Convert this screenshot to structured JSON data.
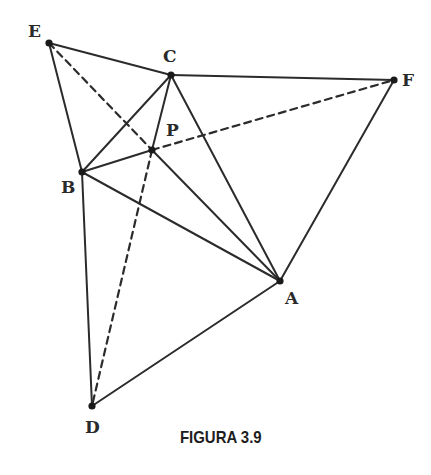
{
  "figure": {
    "caption": "FIGURA 3.9",
    "points": {
      "E": {
        "label": "E",
        "x": 49,
        "y": 43,
        "lx": 28,
        "ly": 37
      },
      "C": {
        "label": "C",
        "x": 171,
        "y": 75,
        "lx": 163,
        "ly": 62
      },
      "F": {
        "label": "F",
        "x": 394,
        "y": 80,
        "lx": 402,
        "ly": 86
      },
      "P": {
        "label": "P",
        "x": 152,
        "y": 150,
        "lx": 166,
        "ly": 136
      },
      "B": {
        "label": "B",
        "x": 82,
        "y": 172,
        "lx": 61,
        "ly": 193
      },
      "A": {
        "label": "A",
        "x": 280,
        "y": 281,
        "lx": 285,
        "ly": 304
      },
      "D": {
        "label": "D",
        "x": 92,
        "y": 406,
        "lx": 85,
        "ly": 433
      }
    },
    "solid_segments": [
      [
        "E",
        "C"
      ],
      [
        "C",
        "F"
      ],
      [
        "F",
        "A"
      ],
      [
        "E",
        "B"
      ],
      [
        "B",
        "D"
      ],
      [
        "D",
        "A"
      ],
      [
        "B",
        "C"
      ],
      [
        "C",
        "A"
      ],
      [
        "B",
        "A"
      ],
      [
        "P",
        "B"
      ],
      [
        "P",
        "C"
      ],
      [
        "P",
        "A"
      ]
    ],
    "dashed_segments": [
      [
        "E",
        "P"
      ],
      [
        "P",
        "F"
      ],
      [
        "P",
        "D"
      ]
    ],
    "colors": {
      "line": "#2b2b2b",
      "background": "#ffffff"
    }
  }
}
